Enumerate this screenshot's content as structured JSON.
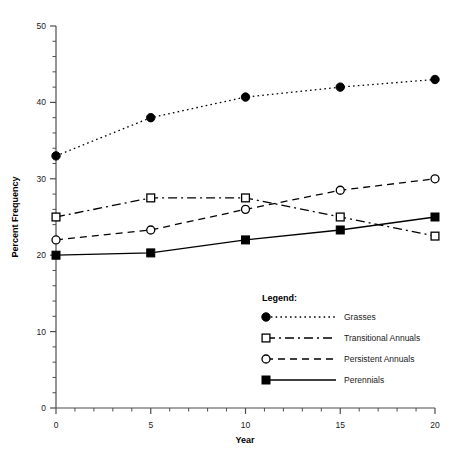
{
  "chart_data": {
    "type": "line",
    "title": "",
    "xlabel": "Year",
    "ylabel": "Percent Frequency",
    "xlim": [
      0,
      20
    ],
    "ylim": [
      0,
      50
    ],
    "x_ticks": [
      "0",
      "5",
      "10",
      "15",
      "20"
    ],
    "y_ticks": [
      "0",
      "10",
      "20",
      "30",
      "40",
      "50"
    ],
    "x_tick_values": [
      0,
      5,
      10,
      15,
      20
    ],
    "y_tick_values": [
      0,
      10,
      20,
      30,
      40,
      50
    ],
    "x_minor_step": 1,
    "y_minor_step": 2,
    "grid": false,
    "legend_position": "inside-lower-right",
    "x": [
      0,
      5,
      10,
      15,
      20
    ],
    "series": [
      {
        "name": "Grasses",
        "values": [
          33,
          38,
          40.7,
          42,
          43
        ],
        "marker": "filled-circle",
        "line": "dotted",
        "color": "#000000"
      },
      {
        "name": "Transitional Annuals",
        "values": [
          25,
          27.5,
          27.5,
          25,
          22.5
        ],
        "marker": "open-square",
        "line": "dash-dot",
        "color": "#000000"
      },
      {
        "name": "Persistent Annuals",
        "values": [
          22,
          23.3,
          26,
          28.5,
          30
        ],
        "marker": "open-circle",
        "line": "dashed",
        "color": "#000000"
      },
      {
        "name": "Perennials",
        "values": [
          20,
          20.3,
          22,
          23.3,
          25
        ],
        "marker": "filled-square",
        "line": "solid",
        "color": "#000000"
      }
    ]
  },
  "legend": {
    "title": "Legend:",
    "entries": [
      {
        "label": "Grasses"
      },
      {
        "label": "Transitional Annuals"
      },
      {
        "label": "Persistent Annuals"
      },
      {
        "label": "Perennials"
      }
    ]
  },
  "axes": {
    "x_title": "Year",
    "y_title": "Percent Frequency"
  }
}
